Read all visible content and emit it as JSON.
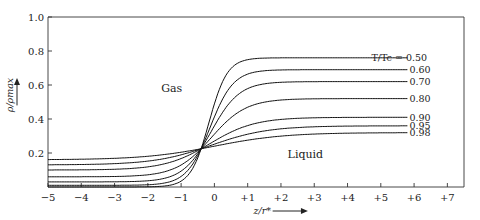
{
  "chart_data": {
    "type": "line",
    "title": "",
    "xlabel": "z/r*",
    "ylabel": "ρ/ρmax",
    "xlim": [
      -5,
      7.5
    ],
    "ylim": [
      0,
      1.0
    ],
    "xticks": [
      -5,
      -4,
      -3,
      -2,
      -1,
      0,
      1,
      2,
      3,
      4,
      5,
      6,
      7
    ],
    "xtick_labels": [
      "−5",
      "−4",
      "−3",
      "−2",
      "−1",
      "0",
      "+1",
      "+2",
      "+3",
      "+4",
      "+5",
      "+6",
      "+7"
    ],
    "yticks": [
      0.2,
      0.4,
      0.6,
      0.8,
      1.0
    ],
    "ytick_labels": [
      "0.2",
      "0.4",
      "0.6",
      "0.8",
      "1.0"
    ],
    "grid": false,
    "legend_prefix": "T/Tc =",
    "annotations": [
      {
        "text": "Gas",
        "x": -1.6,
        "y": 0.56
      },
      {
        "text": "Liquid",
        "x": 2.2,
        "y": 0.17
      }
    ],
    "crossing_point": {
      "x": -0.4,
      "y": 0.225
    },
    "series": [
      {
        "name": "0.50",
        "liquid": 0.76,
        "gas": 0.0,
        "width": 0.55
      },
      {
        "name": "0.60",
        "liquid": 0.69,
        "gas": 0.01,
        "width": 0.7
      },
      {
        "name": "0.70",
        "liquid": 0.62,
        "gas": 0.03,
        "width": 0.85
      },
      {
        "name": "0.80",
        "liquid": 0.52,
        "gas": 0.06,
        "width": 1.05
      },
      {
        "name": "0.90",
        "liquid": 0.41,
        "gas": 0.1,
        "width": 1.35
      },
      {
        "name": "0.95",
        "liquid": 0.36,
        "gas": 0.13,
        "width": 1.7
      },
      {
        "name": "0.98",
        "liquid": 0.32,
        "gas": 0.16,
        "width": 2.1
      }
    ]
  }
}
